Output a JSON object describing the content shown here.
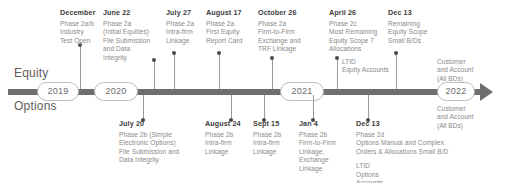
{
  "bands": {
    "top_label": "Equity",
    "bottom_label": "Options"
  },
  "years": [
    {
      "label": "2019"
    },
    {
      "label": "2020"
    },
    {
      "label": "2021"
    },
    {
      "label": "2022"
    }
  ],
  "top_milestones": [
    {
      "date": "December",
      "lines": [
        "Phase 2a/b",
        "Industry",
        "Test Open"
      ]
    },
    {
      "date": "June 22",
      "lines": [
        "Phase 2a",
        "(Initial Equities)",
        "File Submission",
        "and Data",
        "Integrity"
      ]
    },
    {
      "date": "July 27",
      "lines": [
        "Phase 2a",
        "Intra-firm",
        "Linkage"
      ]
    },
    {
      "date": "August 17",
      "lines": [
        "Phase 2a",
        "First Equity",
        "Report Card"
      ]
    },
    {
      "date": "October 26",
      "lines": [
        "Phase 2a",
        "Firm-to-Firm",
        "Exchange and",
        "TRF Linkage"
      ]
    },
    {
      "date": "April 26",
      "lines": [
        "Phase 2c",
        "Most Remaining",
        "Equity Scope 7",
        "Allocations"
      ],
      "sub": [
        "LTID",
        "Equity Accounts"
      ]
    },
    {
      "date": "Dec 13",
      "lines": [
        "Remaining",
        "Equity Scope",
        "Small B/Ds"
      ]
    }
  ],
  "bottom_milestones": [
    {
      "date": "July 20",
      "lines": [
        "Phase 2b (Simple",
        "Electronic Options)",
        "File Submission and",
        "Data Integrity"
      ]
    },
    {
      "date": "August 24",
      "lines": [
        "Phase 2b",
        "Intra-firm",
        "Linkage"
      ]
    },
    {
      "date": "Sept 15",
      "lines": [
        "Phase 2b",
        "Intra-firm",
        "Linkage"
      ]
    },
    {
      "date": "Jan 4",
      "lines": [
        "Phase 2b",
        "Firm-to-Firm",
        "Linkage,",
        "Exchange",
        "Linkage"
      ]
    },
    {
      "date": "Dec 13",
      "lines": [
        "Phase 2d",
        "Options Manual and Complex",
        "Orders & Allocations Small B/D"
      ],
      "sub": [
        "LTID",
        "Options",
        "Accounts"
      ]
    }
  ],
  "end_notes": {
    "top": [
      "Customer",
      "and Account",
      "(All BDs)"
    ],
    "bottom": [
      "Customer",
      "and Account",
      "(All BDs)"
    ]
  },
  "colors": {
    "axis": "#6e6e6e",
    "dot": "#4a4a4a",
    "stem": "#9a9a9a",
    "date_text": "#3d3d3d",
    "body_text": "#8a8a8a",
    "band_text": "#5d5d5d",
    "year_text": "#6b6b6b",
    "year_border": "#bdbdbd"
  }
}
